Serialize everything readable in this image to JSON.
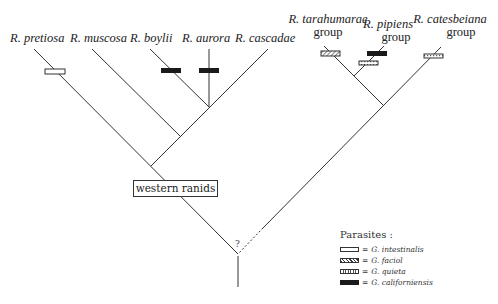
{
  "diagram": {
    "type": "phylogenetic-tree",
    "taxa_left": [
      {
        "label": "R. pretiosa",
        "x": 10
      },
      {
        "label": "R. muscosa",
        "x": 70
      },
      {
        "label": "R. boylii",
        "x": 130
      },
      {
        "label": "R. aurora",
        "x": 182
      },
      {
        "label": "R. cascadae",
        "x": 235
      }
    ],
    "taxa_right": [
      {
        "line1": "R. tarahumarae",
        "line2": "group"
      },
      {
        "line1": "R. pipiens",
        "line2": "group"
      },
      {
        "line1": "R. catesbeiana",
        "line2": "group"
      }
    ],
    "clade_label": "western ranids",
    "root_mark": "?",
    "legend": {
      "title": "Parasites :",
      "items": [
        {
          "swatch": "open",
          "eq": "=",
          "label": "G. intestinalis"
        },
        {
          "swatch": "hatched",
          "eq": "=",
          "label": "G. faciol"
        },
        {
          "swatch": "dotted",
          "eq": "=",
          "label": "G. quieta"
        },
        {
          "swatch": "solid",
          "eq": "=",
          "label": "G. californiensis"
        }
      ]
    },
    "parasite_marks": [
      {
        "taxon": "R. pretiosa",
        "parasite": "G. intestinalis"
      },
      {
        "taxon": "R. boylii",
        "parasite": "G. californiensis"
      },
      {
        "taxon": "R. aurora",
        "parasite": "G. californiensis"
      },
      {
        "taxon": "R. tarahumarae group",
        "parasite": "G. faciol"
      },
      {
        "taxon": "R. pipiens group",
        "parasite": "G. californiensis"
      },
      {
        "taxon": "R. pipiens group",
        "parasite": "G. quieta"
      },
      {
        "taxon": "R. catesbeiana group",
        "parasite": "G. quieta"
      }
    ]
  }
}
